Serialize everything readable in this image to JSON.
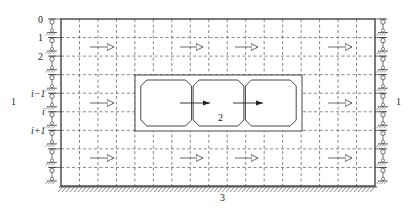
{
  "diagram": {
    "title": "",
    "row_labels": [
      {
        "id": "row-0",
        "text": "0"
      },
      {
        "id": "row-1",
        "text": "1"
      },
      {
        "id": "row-2",
        "text": "2"
      },
      {
        "id": "row-i-minus-1",
        "text": "i−1"
      },
      {
        "id": "row-i",
        "text": "i"
      },
      {
        "id": "row-i-plus-1",
        "text": "i+1"
      }
    ],
    "region_labels": {
      "left_boundary": "1",
      "right_boundary": "1",
      "structure": "2",
      "bottom_boundary": "3"
    },
    "grid": {
      "columns": 17,
      "rows": 9
    },
    "flow_arrows": {
      "count_per_row": 4,
      "rows": 3,
      "style": "open-head"
    },
    "structure": {
      "cells": 3,
      "internal_arrows": 2,
      "internal_arrow_style": "filled-head"
    },
    "colors": {
      "line": "#333333",
      "dash": "#555555",
      "background": "#ffffff"
    }
  }
}
